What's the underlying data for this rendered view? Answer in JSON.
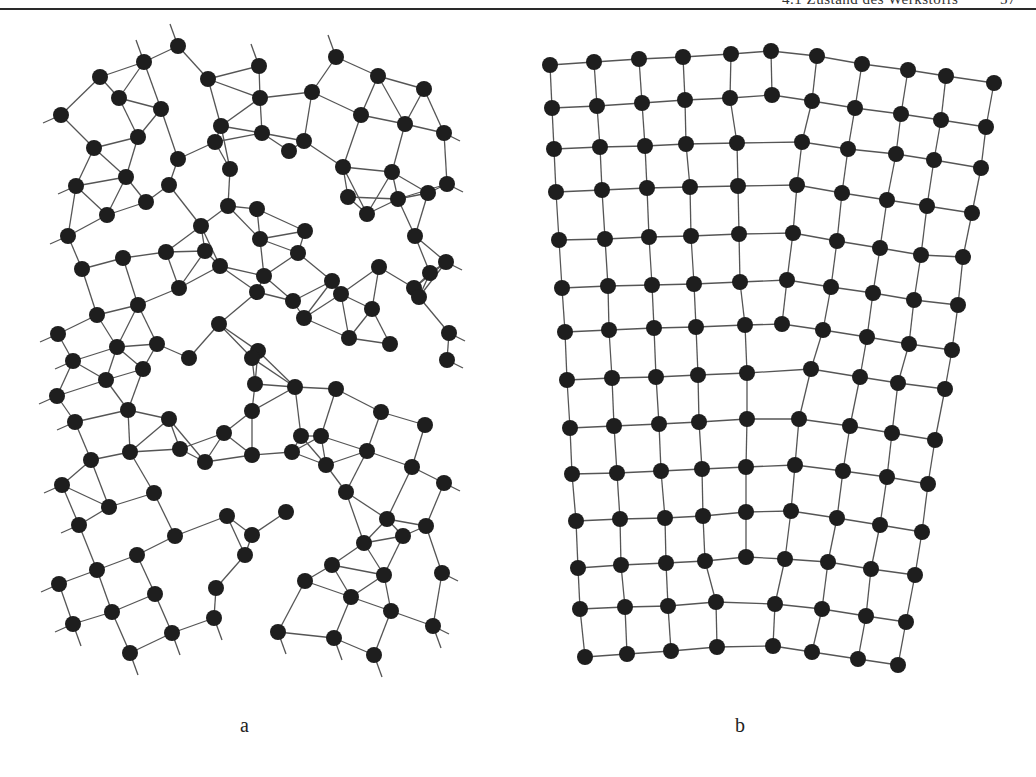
{
  "header": {
    "title": "4.1 Zustand des Werkstoffs",
    "page": "57"
  },
  "figures": [
    {
      "id": "a",
      "label": "a",
      "description": "Square lattice split into two misoriented domains (tilt boundary) with dislocation core",
      "node_color": "#1e1e1e",
      "bond_color": "#555555",
      "node_radius": 8,
      "nodes": [
        [
          178,
          46
        ],
        [
          100,
          77
        ],
        [
          144,
          62
        ],
        [
          208,
          79
        ],
        [
          259,
          66
        ],
        [
          336,
          57
        ],
        [
          378,
          76
        ],
        [
          424,
          89
        ],
        [
          61,
          115
        ],
        [
          119,
          98
        ],
        [
          161,
          109
        ],
        [
          260,
          98
        ],
        [
          221,
          126
        ],
        [
          312,
          92
        ],
        [
          361,
          115
        ],
        [
          405,
          124
        ],
        [
          444,
          133
        ],
        [
          94,
          148
        ],
        [
          138,
          137
        ],
        [
          178,
          159
        ],
        [
          215,
          142
        ],
        [
          262,
          133
        ],
        [
          304,
          141
        ],
        [
          343,
          167
        ],
        [
          392,
          172
        ],
        [
          447,
          184
        ],
        [
          76,
          186
        ],
        [
          126,
          177
        ],
        [
          169,
          185
        ],
        [
          230,
          169
        ],
        [
          289,
          151
        ],
        [
          348,
          197
        ],
        [
          398,
          199
        ],
        [
          428,
          193
        ],
        [
          68,
          236
        ],
        [
          107,
          215
        ],
        [
          146,
          202
        ],
        [
          201,
          226
        ],
        [
          228,
          206
        ],
        [
          257,
          209
        ],
        [
          305,
          231
        ],
        [
          367,
          214
        ],
        [
          415,
          236
        ],
        [
          446,
          262
        ],
        [
          82,
          269
        ],
        [
          123,
          258
        ],
        [
          166,
          252
        ],
        [
          205,
          251
        ],
        [
          260,
          239
        ],
        [
          298,
          253
        ],
        [
          332,
          281
        ],
        [
          379,
          267
        ],
        [
          414,
          288
        ],
        [
          430,
          273
        ],
        [
          58,
          334
        ],
        [
          97,
          315
        ],
        [
          138,
          305
        ],
        [
          179,
          288
        ],
        [
          220,
          266
        ],
        [
          264,
          276
        ],
        [
          293,
          301
        ],
        [
          341,
          294
        ],
        [
          372,
          309
        ],
        [
          419,
          297
        ],
        [
          449,
          333
        ],
        [
          73,
          361
        ],
        [
          117,
          347
        ],
        [
          157,
          344
        ],
        [
          219,
          324
        ],
        [
          257,
          292
        ],
        [
          258,
          351
        ],
        [
          304,
          318
        ],
        [
          349,
          338
        ],
        [
          390,
          344
        ],
        [
          447,
          360
        ],
        [
          57,
          396
        ],
        [
          106,
          380
        ],
        [
          143,
          369
        ],
        [
          189,
          358
        ],
        [
          252,
          358
        ],
        [
          295,
          387
        ],
        [
          336,
          389
        ],
        [
          381,
          412
        ],
        [
          425,
          425
        ],
        [
          75,
          422
        ],
        [
          128,
          410
        ],
        [
          169,
          419
        ],
        [
          224,
          433
        ],
        [
          255,
          384
        ],
        [
          321,
          436
        ],
        [
          367,
          451
        ],
        [
          412,
          467
        ],
        [
          444,
          483
        ],
        [
          62,
          485
        ],
        [
          91,
          460
        ],
        [
          130,
          452
        ],
        [
          180,
          449
        ],
        [
          252,
          411
        ],
        [
          301,
          436
        ],
        [
          346,
          492
        ],
        [
          387,
          519
        ],
        [
          426,
          526
        ],
        [
          79,
          525
        ],
        [
          109,
          507
        ],
        [
          154,
          493
        ],
        [
          205,
          462
        ],
        [
          252,
          455
        ],
        [
          292,
          452
        ],
        [
          326,
          465
        ],
        [
          364,
          543
        ],
        [
          403,
          536
        ],
        [
          59,
          584
        ],
        [
          97,
          570
        ],
        [
          137,
          555
        ],
        [
          175,
          536
        ],
        [
          227,
          516
        ],
        [
          252,
          535
        ],
        [
          286,
          512
        ],
        [
          332,
          565
        ],
        [
          384,
          575
        ],
        [
          442,
          573
        ],
        [
          112,
          612
        ],
        [
          155,
          594
        ],
        [
          216,
          588
        ],
        [
          245,
          555
        ],
        [
          305,
          581
        ],
        [
          351,
          597
        ],
        [
          391,
          611
        ],
        [
          73,
          624
        ],
        [
          130,
          653
        ],
        [
          172,
          633
        ],
        [
          214,
          618
        ],
        [
          278,
          632
        ],
        [
          334,
          638
        ],
        [
          374,
          655
        ],
        [
          433,
          626
        ]
      ],
      "bonds_style": "nearest-neighbour, stub lines at edges",
      "caption_position": [
        240,
        714
      ]
    },
    {
      "id": "b",
      "label": "b",
      "description": "Bent square lattice with excess edge dislocations (half-planes) terminating inside",
      "node_color": "#1e1e1e",
      "bond_color": "#555555",
      "node_radius": 8,
      "rows": [
        [
          [
            550,
            65
          ],
          [
            594,
            62
          ],
          [
            639,
            59
          ],
          [
            683,
            57
          ],
          [
            731,
            54
          ],
          [
            771,
            51
          ],
          [
            817,
            56
          ],
          [
            862,
            64
          ],
          [
            908,
            70
          ],
          [
            946,
            76
          ],
          [
            994,
            83
          ]
        ],
        [
          [
            552,
            108
          ],
          [
            597,
            106
          ],
          [
            642,
            103
          ],
          [
            685,
            100
          ],
          [
            730,
            98
          ],
          [
            772,
            95
          ],
          [
            812,
            101
          ],
          [
            855,
            108
          ],
          [
            901,
            114
          ],
          [
            941,
            120
          ],
          [
            986,
            127
          ]
        ],
        [
          [
            554,
            149
          ],
          [
            600,
            147
          ],
          [
            645,
            146
          ],
          [
            686,
            144
          ],
          [
            737,
            143
          ],
          [
            802,
            142
          ],
          [
            848,
            149
          ],
          [
            896,
            154
          ],
          [
            934,
            160
          ],
          [
            981,
            168
          ]
        ],
        [
          [
            556,
            192
          ],
          [
            602,
            190
          ],
          [
            647,
            188
          ],
          [
            690,
            187
          ],
          [
            738,
            186
          ],
          [
            797,
            185
          ],
          [
            842,
            193
          ],
          [
            887,
            200
          ],
          [
            927,
            206
          ],
          [
            972,
            213
          ]
        ],
        [
          [
            559,
            240
          ],
          [
            605,
            239
          ],
          [
            649,
            237
          ],
          [
            691,
            236
          ],
          [
            739,
            234
          ],
          [
            793,
            233
          ],
          [
            837,
            241
          ],
          [
            880,
            248
          ],
          [
            921,
            255
          ],
          [
            963,
            257
          ]
        ],
        [
          [
            562,
            288
          ],
          [
            608,
            286
          ],
          [
            652,
            285
          ],
          [
            694,
            284
          ],
          [
            740,
            282
          ],
          [
            787,
            280
          ],
          [
            831,
            287
          ],
          [
            873,
            293
          ],
          [
            914,
            300
          ],
          [
            958,
            305
          ]
        ],
        [
          [
            565,
            332
          ],
          [
            609,
            330
          ],
          [
            654,
            328
          ],
          [
            696,
            327
          ],
          [
            745,
            325
          ],
          [
            782,
            324
          ],
          [
            823,
            330
          ],
          [
            867,
            337
          ],
          [
            909,
            344
          ],
          [
            952,
            350
          ]
        ],
        [
          [
            567,
            380
          ],
          [
            612,
            378
          ],
          [
            656,
            377
          ],
          [
            698,
            375
          ],
          [
            747,
            373
          ],
          [
            811,
            369
          ],
          [
            860,
            377
          ],
          [
            898,
            383
          ],
          [
            945,
            389
          ]
        ],
        [
          [
            570,
            428
          ],
          [
            614,
            426
          ],
          [
            659,
            424
          ],
          [
            699,
            422
          ],
          [
            747,
            419
          ],
          [
            799,
            419
          ],
          [
            850,
            426
          ],
          [
            892,
            433
          ],
          [
            935,
            440
          ]
        ],
        [
          [
            572,
            474
          ],
          [
            617,
            473
          ],
          [
            661,
            471
          ],
          [
            702,
            469
          ],
          [
            746,
            467
          ],
          [
            795,
            465
          ],
          [
            843,
            471
          ],
          [
            887,
            477
          ],
          [
            928,
            484
          ]
        ],
        [
          [
            576,
            521
          ],
          [
            620,
            519
          ],
          [
            665,
            518
          ],
          [
            703,
            516
          ],
          [
            746,
            512
          ],
          [
            791,
            511
          ],
          [
            837,
            518
          ],
          [
            880,
            525
          ],
          [
            922,
            532
          ]
        ],
        [
          [
            578,
            568
          ],
          [
            621,
            565
          ],
          [
            666,
            563
          ],
          [
            705,
            561
          ],
          [
            746,
            557
          ],
          [
            785,
            559
          ],
          [
            828,
            562
          ],
          [
            871,
            569
          ],
          [
            915,
            575
          ]
        ],
        [
          [
            580,
            609
          ],
          [
            625,
            607
          ],
          [
            668,
            606
          ],
          [
            716,
            602
          ],
          [
            775,
            604
          ],
          [
            822,
            609
          ],
          [
            866,
            616
          ],
          [
            906,
            622
          ]
        ],
        [
          [
            585,
            657
          ],
          [
            627,
            654
          ],
          [
            671,
            651
          ],
          [
            717,
            647
          ],
          [
            773,
            646
          ],
          [
            812,
            652
          ],
          [
            858,
            659
          ],
          [
            898,
            665
          ]
        ]
      ],
      "caption_position": [
        735,
        714
      ]
    }
  ],
  "captions": {
    "a": "a",
    "b": "b"
  }
}
